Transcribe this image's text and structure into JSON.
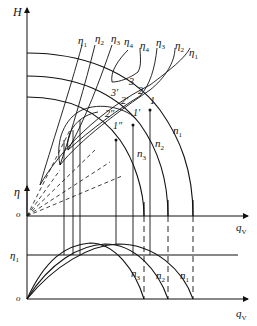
{
  "top_chart": {
    "y_axis_label": "H",
    "x_axis_label": "q_V",
    "origin_label": "o",
    "speed_curves": [
      {
        "label": "n1"
      },
      {
        "label": "n2"
      },
      {
        "label": "n3"
      }
    ],
    "iso_efficiency_labels": [
      "η1",
      "η2",
      "η3",
      "η4",
      "η4",
      "η3",
      "η2",
      "η1"
    ],
    "operating_points": [
      "1",
      "2",
      "3",
      "1'",
      "2'",
      "3'",
      "1''",
      "2''"
    ]
  },
  "bottom_chart": {
    "y_axis_label": "η",
    "x_axis_label": "q_V",
    "origin_label": "o",
    "reference_line_label": "η1",
    "efficiency_curves": [
      {
        "label": "n3"
      },
      {
        "label": "n2"
      },
      {
        "label": "n1"
      }
    ]
  },
  "text": {
    "H": "H",
    "eta": "η",
    "qv_main": "q",
    "qv_sub": "V",
    "o": "o",
    "eta_sym": "η",
    "s1": "1",
    "s2": "2",
    "s3": "3",
    "s4": "4",
    "n": "n",
    "p1": "1",
    "p2": "2",
    "p3": "3",
    "p1p": "1′",
    "p2p": "2′",
    "p3p": "3′",
    "p1pp": "1″",
    "p2pp": "2″"
  }
}
